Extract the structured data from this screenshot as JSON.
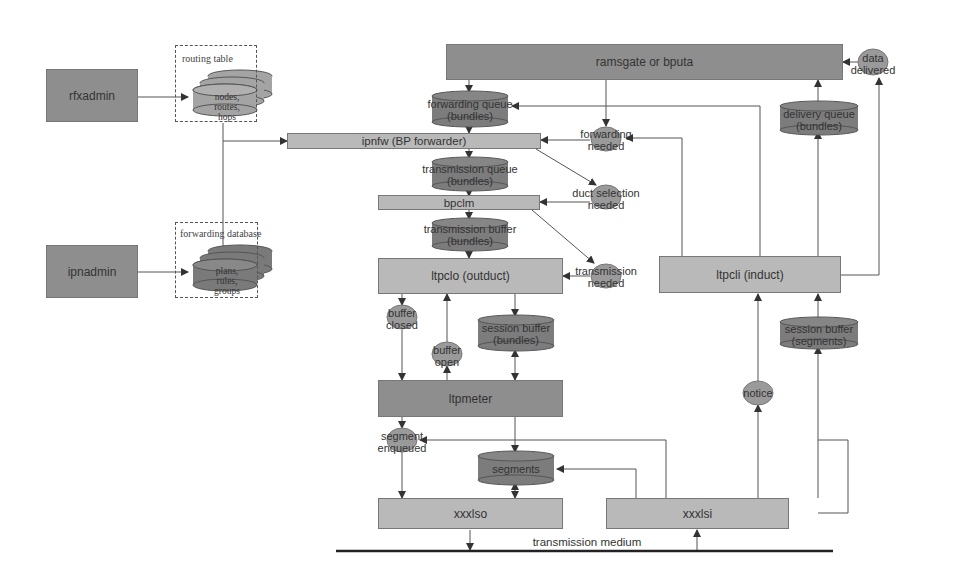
{
  "diagram": {
    "admins": {
      "rfxadmin": "rfxadmin",
      "ipnadmin": "ipnadmin"
    },
    "stores": {
      "routing_table": {
        "title": "routing table",
        "lines": [
          "nodes,",
          "routes,",
          "hops"
        ]
      },
      "forwarding_database": {
        "title": "forwarding database",
        "lines": [
          "plans,",
          "rules,",
          "groups"
        ]
      }
    },
    "processes": {
      "app": "ramsgate or bputa",
      "ipnfw": "ipnfw (BP forwarder)",
      "bpclm": "bpclm",
      "ltpclo": "ltpclo (outduct)",
      "ltpcli": "ltpcli (induct)",
      "ltpmeter": "ltpmeter",
      "xxxlso": "xxxlso",
      "xxxlsi": "xxxlsi"
    },
    "queues": {
      "forwarding_queue": [
        "forwarding queue",
        "(bundles)"
      ],
      "transmission_queue": [
        "transmission queue",
        "(bundles)"
      ],
      "transmission_buffer": [
        "transmission buffer",
        "(bundles)"
      ],
      "session_buffer_out": [
        "session buffer",
        "(bundles)"
      ],
      "segments": [
        "segments"
      ],
      "delivery_queue": [
        "delivery queue",
        "(bundles)"
      ],
      "session_buffer_in": [
        "session buffer",
        "(segments)"
      ]
    },
    "signals": {
      "data_delivered": [
        "data",
        "delivered"
      ],
      "forwarding_needed": [
        "forwarding",
        "needed"
      ],
      "duct_selection_needed": [
        "duct selection",
        "needed"
      ],
      "transmission_needed": [
        "transmission",
        "needed"
      ],
      "buffer_closed": [
        "buffer",
        "closed"
      ],
      "buffer_open": [
        "buffer",
        "open"
      ],
      "segment_enqueued": [
        "segment",
        "enqueued"
      ],
      "notice": [
        "notice"
      ]
    },
    "medium": "transmission medium"
  },
  "colors": {
    "dark_box": "#8e8e8e",
    "light_box": "#b9b9b9",
    "cylinder": "#7c7c7c",
    "signal": "#9a9a9a",
    "line": "#555555"
  }
}
